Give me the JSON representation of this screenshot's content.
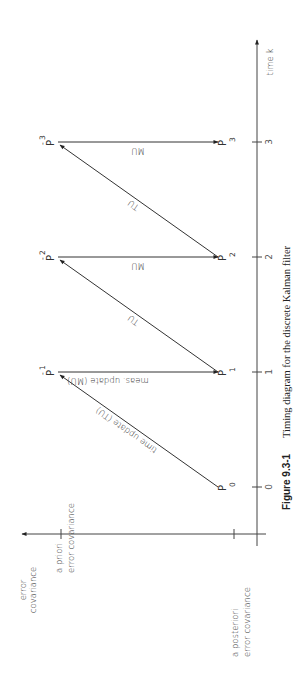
{
  "figure": {
    "number": "Figure 9.3-1",
    "caption": "Timing diagram for the discrete Kalman filter",
    "orientation": "rotated 90° counter-clockwise"
  },
  "axes": {
    "x_axis_label": "time  k",
    "y_axis_label_line1": "error",
    "y_axis_label_line2": "covariance",
    "a_priori_line1": "a priori",
    "a_priori_line2": "error covariance",
    "a_posteriori_line1": "a posteriori",
    "a_posteriori_line2": "error covariance",
    "ticks": [
      "0",
      "1",
      "2",
      "3"
    ]
  },
  "nodes": {
    "posterior": [
      {
        "symbol": "P",
        "sub": "0"
      },
      {
        "symbol": "P",
        "sub": "1"
      },
      {
        "symbol": "P",
        "sub": "2"
      },
      {
        "symbol": "P",
        "sub": "3"
      }
    ],
    "prior": [
      {
        "symbol": "P",
        "sup": "-",
        "sub": "1"
      },
      {
        "symbol": "P",
        "sup": "-",
        "sub": "2"
      },
      {
        "symbol": "P",
        "sup": "-",
        "sub": "3"
      }
    ]
  },
  "edges": {
    "tu_first": "time update (TU)",
    "mu_first": "meas. update (MU)",
    "tu": "TU",
    "mu": "MU"
  },
  "colors": {
    "ink": "#333333",
    "background": "#ffffff"
  }
}
